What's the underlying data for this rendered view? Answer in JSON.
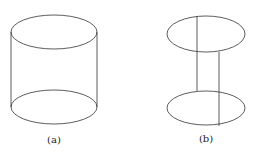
{
  "figures": [
    {
      "id": "a",
      "label": "(a)",
      "description": "cylinder",
      "top_ellipse": {
        "cx": 54,
        "cy": 32,
        "rx": 43,
        "ry": 17
      },
      "bottom_ellipse": {
        "cx": 54,
        "cy": 107,
        "rx": 43,
        "ry": 17
      },
      "sides": [
        {
          "x1": 11,
          "y1": 32,
          "x2": 11,
          "y2": 107
        },
        {
          "x1": 97,
          "y1": 32,
          "x2": 97,
          "y2": 107
        }
      ],
      "label_pos": {
        "x": 54,
        "y": 143
      }
    },
    {
      "id": "b",
      "label": "(b)",
      "description": "two disks connected by two vertical segments",
      "top_ellipse": {
        "cx": 206,
        "cy": 34,
        "rx": 39,
        "ry": 18
      },
      "bottom_ellipse": {
        "cx": 206,
        "cy": 108,
        "rx": 39,
        "ry": 17
      },
      "connectors": [
        {
          "x1": 197,
          "y1": 16,
          "x2": 197,
          "y2": 91
        },
        {
          "x1": 219,
          "y1": 52,
          "x2": 219,
          "y2": 126
        }
      ],
      "label_pos": {
        "x": 206,
        "y": 142
      }
    }
  ],
  "stroke_color": "#333333"
}
